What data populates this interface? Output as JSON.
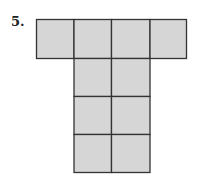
{
  "problem": {
    "number": "5.",
    "figure": {
      "description": "T-shaped net of squares: top row of 4 squares, below it 3 rows of 2 centered squares",
      "fill": "#d6d6d6",
      "stroke": "#333333",
      "top_row_cells": 4,
      "column_rows": 3,
      "column_cells_per_row": 2
    }
  }
}
